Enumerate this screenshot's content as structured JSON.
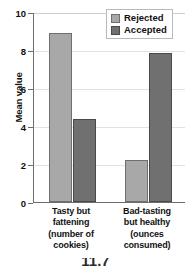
{
  "chart_data": {
    "type": "bar",
    "title": "",
    "xlabel": "",
    "ylabel": "Mean value",
    "ylim": [
      0,
      10
    ],
    "yticks": [
      0,
      2,
      4,
      6,
      8,
      10
    ],
    "ytick_labels": [
      "0",
      "2",
      "4",
      "6",
      "8",
      "10"
    ],
    "grid": true,
    "grid_axis": "y",
    "legend_position": "top-right",
    "categories": [
      "Tasty but fattening (number of cookies)",
      "Bad-tasting but healthy (ounces consumed)"
    ],
    "category_lines": [
      [
        "Tasty but",
        "fattening",
        "(number of",
        "cookies)"
      ],
      [
        "Bad-tasting",
        "but healthy",
        "(ounces",
        "consumed)"
      ]
    ],
    "series": [
      {
        "name": "Rejected",
        "color": "#a8a8a8",
        "values": [
          8.9,
          2.2
        ]
      },
      {
        "name": "Accepted",
        "color": "#707070",
        "values": [
          4.35,
          7.85
        ]
      }
    ]
  },
  "legend": {
    "items": [
      {
        "label": "Rejected",
        "color": "#a8a8a8"
      },
      {
        "label": "Accepted",
        "color": "#707070"
      }
    ]
  },
  "caption": {
    "text": "11.7"
  },
  "colors": {
    "rejected": "#a8a8a8",
    "accepted": "#707070",
    "axis": "#6d6d6d",
    "grid": "#e2e2e2",
    "text": "#111111",
    "background": "#ffffff"
  }
}
